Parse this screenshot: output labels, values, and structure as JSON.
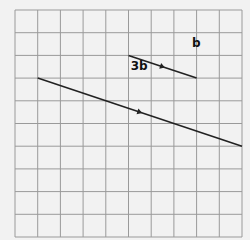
{
  "diagram": {
    "grid": {
      "columns": 10,
      "rows": 10,
      "origin_px": [
        15,
        10
      ],
      "cell_px": 22.7,
      "line_color": "#9a9a9a",
      "background": "#f2f2f2"
    },
    "vectors": [
      {
        "label": "b",
        "start": [
          5,
          2
        ],
        "end": [
          8,
          3
        ],
        "label_offset": [
          2.8,
          -0.35
        ]
      },
      {
        "label": "3b",
        "start": [
          1,
          3
        ],
        "end": [
          10,
          6
        ],
        "label_offset": [
          4.1,
          -0.35
        ]
      }
    ],
    "line_color": "#222222"
  }
}
